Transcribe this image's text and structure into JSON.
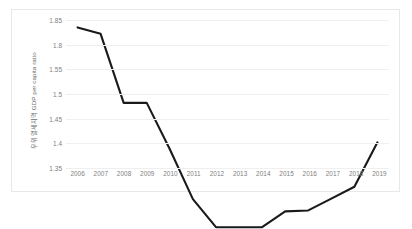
{
  "chart_data": {
    "type": "line",
    "title": "",
    "subtitle": "",
    "xlabel": "",
    "ylabel": "우위열세지역 GDP per capita ratio",
    "ylim": [
      1.35,
      1.85
    ],
    "xlim": [
      2006,
      2019
    ],
    "grid": true,
    "legend": false,
    "legend_position": "none",
    "line_color": "#1a1a1a",
    "grid_color": "#efefef",
    "border_color": "#e8e8e8",
    "tick_color": "#808080",
    "ytick_labels": [
      "1.85",
      "1.8",
      "1.55",
      "1.5",
      "1.45",
      "1.4",
      "1.35"
    ],
    "ytick_values": [
      1.85,
      1.8,
      1.75,
      1.7,
      1.65,
      1.6,
      1.55
    ],
    "ytick_count": 7,
    "categories": [
      "2006",
      "2007",
      "2008",
      "2009",
      "2010",
      "2011",
      "2012",
      "2013",
      "2014",
      "2015",
      "2016",
      "2017",
      "2018",
      "2019"
    ],
    "x": [
      2006,
      2007,
      2008,
      2009,
      2010,
      2011,
      2012,
      2013,
      2014,
      2015,
      2016,
      2017,
      2018,
      2019
    ],
    "values": [
      1.835,
      1.822,
      1.682,
      1.682,
      1.588,
      1.487,
      1.43,
      1.43,
      1.43,
      1.462,
      1.464,
      1.488,
      1.512,
      1.602
    ],
    "series": [
      {
        "name": "GDP per capita ratio",
        "values": [
          1.835,
          1.822,
          1.682,
          1.682,
          1.588,
          1.487,
          1.43,
          1.43,
          1.43,
          1.462,
          1.464,
          1.488,
          1.512,
          1.602
        ]
      }
    ]
  }
}
